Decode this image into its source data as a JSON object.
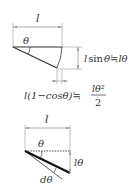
{
  "diagram_top": {
    "length_label": "l",
    "angle_label": "θ",
    "vertical_label": "l sin θ ≒ lθ",
    "vertical_parts": {
      "a": "l",
      "b": "sin",
      "c": "θ",
      "d": "≒",
      "e": "lθ"
    },
    "horizontal_label": {
      "prefix": "l(1−cosθ)≒",
      "numerator": "lθ²",
      "denominator": "2"
    }
  },
  "diagram_bottom": {
    "length_label": "l",
    "angle_label": "θ",
    "arc_label": "lθ",
    "delta_label": "dθ"
  },
  "colors": {
    "line": "#333333",
    "dim_line": "#999999",
    "thick_line": "#111111"
  }
}
